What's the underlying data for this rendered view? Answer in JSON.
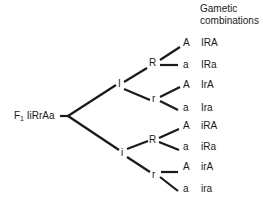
{
  "header": {
    "line1": "Gametic",
    "line2": "combinations"
  },
  "root": {
    "prefix": "F",
    "subscript": "1",
    "genotype": "IiRrAa"
  },
  "level1": [
    {
      "allele": "I"
    },
    {
      "allele": "i"
    }
  ],
  "level2": [
    {
      "allele": "R"
    },
    {
      "allele": "r"
    },
    {
      "allele": "R"
    },
    {
      "allele": "r"
    }
  ],
  "level3": [
    {
      "allele": "A",
      "gamete": "IRA"
    },
    {
      "allele": "a",
      "gamete": "IRa"
    },
    {
      "allele": "A",
      "gamete": "IrA"
    },
    {
      "allele": "a",
      "gamete": "Ira"
    },
    {
      "allele": "A",
      "gamete": "iRA"
    },
    {
      "allele": "a",
      "gamete": "iRa"
    },
    {
      "allele": "A",
      "gamete": "irA"
    },
    {
      "allele": "a",
      "gamete": "ira"
    }
  ],
  "colors": {
    "line": "#1a1a1a",
    "text": "#1a1a1a"
  }
}
